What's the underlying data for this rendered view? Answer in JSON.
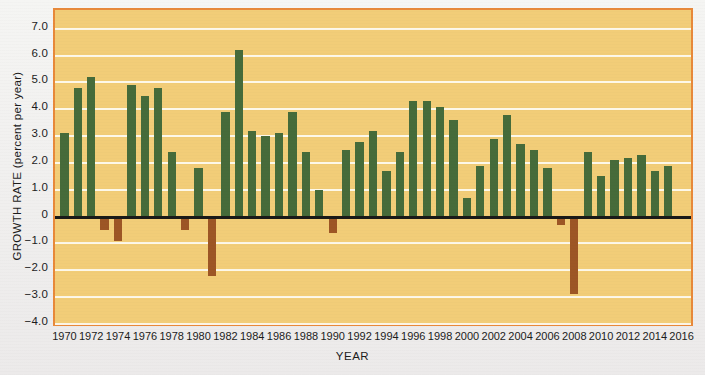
{
  "chart_data": {
    "type": "bar",
    "title": "",
    "xlabel": "YEAR",
    "ylabel": "GROWTH RATE (percent per year)",
    "ylim": [
      -4.0,
      7.7
    ],
    "xlim": [
      1969.3,
      2016.7
    ],
    "grid": true,
    "legend": "none",
    "colors": {
      "positive_bar": "#466b3a",
      "negative_bar": "#9d5625",
      "plot_background": "#f2cd78",
      "frame_border": "#e8893a",
      "gridline": "#fdfaef",
      "zero_axis": "#1a1a18",
      "figure_background": "#f2f2f0"
    },
    "ytick_labels": [
      "7.0",
      "6.0",
      "5.0",
      "4.0",
      "3.0",
      "2.0",
      "1.0",
      "0",
      "−1.0",
      "−2.0",
      "−3.0",
      "−4.0"
    ],
    "ytick_values": [
      7.0,
      6.0,
      5.0,
      4.0,
      3.0,
      2.0,
      1.0,
      0,
      -1.0,
      -2.0,
      -3.0,
      -4.0
    ],
    "xtick_labels": [
      "1970",
      "1972",
      "1974",
      "1976",
      "1978",
      "1980",
      "1982",
      "1984",
      "1986",
      "1988",
      "1990",
      "1992",
      "1994",
      "1996",
      "1998",
      "2000",
      "2002",
      "2004",
      "2006",
      "2008",
      "2010",
      "2012",
      "2014",
      "2016"
    ],
    "xtick_values": [
      1970,
      1972,
      1974,
      1976,
      1978,
      1980,
      1982,
      1984,
      1986,
      1988,
      1990,
      1992,
      1994,
      1996,
      1998,
      2000,
      2002,
      2004,
      2006,
      2008,
      2010,
      2012,
      2014,
      2016
    ],
    "categories": [
      1970,
      1971,
      1972,
      1973,
      1974,
      1975,
      1976,
      1977,
      1978,
      1979,
      1980,
      1981,
      1982,
      1983,
      1984,
      1985,
      1986,
      1987,
      1988,
      1989,
      1990,
      1991,
      1992,
      1993,
      1994,
      1995,
      1996,
      1997,
      1998,
      1999,
      2000,
      2001,
      2002,
      2003,
      2004,
      2005,
      2006,
      2007,
      2008,
      2009,
      2010,
      2011,
      2012,
      2013,
      2014,
      2015,
      2016
    ],
    "values": [
      3.1,
      4.8,
      5.2,
      -0.5,
      -0.9,
      4.9,
      4.5,
      4.8,
      2.4,
      -0.5,
      1.8,
      -2.2,
      3.9,
      6.2,
      3.2,
      3.0,
      3.1,
      3.9,
      2.4,
      1.0,
      -0.6,
      2.5,
      2.8,
      3.2,
      1.7,
      2.4,
      4.3,
      4.3,
      4.1,
      3.6,
      0.7,
      1.9,
      2.9,
      3.8,
      2.7,
      2.5,
      1.8,
      -0.3,
      -2.9,
      2.4,
      1.5,
      2.1,
      2.2,
      2.3,
      1.7,
      1.9,
      0.0
    ]
  },
  "axes": {
    "y_title": "GROWTH RATE (percent per year)",
    "x_title": "YEAR"
  }
}
